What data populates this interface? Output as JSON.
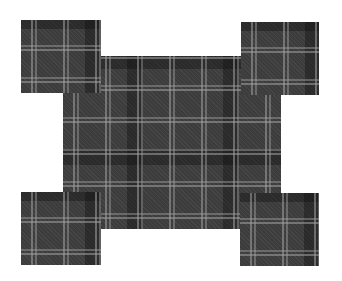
{
  "figure": {
    "colors": {
      "background": "#ffffff",
      "base": "#3c3c3c",
      "stripe": "#a0a0a0",
      "dark_band": "#0a0a0a"
    },
    "shapes": [
      {
        "name": "center-rect",
        "x": 63,
        "y": 56,
        "w": 218,
        "h": 173
      },
      {
        "name": "corner-top-left",
        "x": 21,
        "y": 20,
        "w": 80,
        "h": 73
      },
      {
        "name": "corner-top-right",
        "x": 241,
        "y": 22,
        "w": 78,
        "h": 73
      },
      {
        "name": "corner-bottom-left",
        "x": 21,
        "y": 192,
        "w": 80,
        "h": 73
      },
      {
        "name": "corner-bottom-right",
        "x": 240,
        "y": 193,
        "w": 79,
        "h": 73
      }
    ]
  }
}
